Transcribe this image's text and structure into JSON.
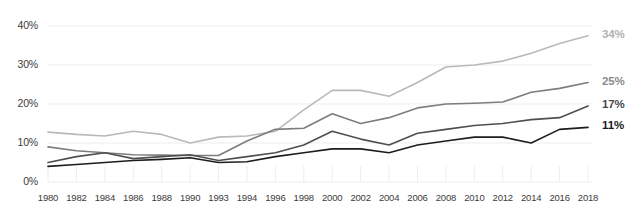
{
  "chart_data": {
    "type": "line",
    "title": "",
    "subtitle": "",
    "xlabel": "",
    "ylabel": "",
    "ylim": [
      0,
      40
    ],
    "yticks": [
      0,
      10,
      20,
      30,
      40
    ],
    "ytick_labels": [
      "0%",
      "10%",
      "20%",
      "30%",
      "40%"
    ],
    "grid": true,
    "legend_position": "end-of-line",
    "categories": [
      "1980",
      "1982",
      "1984",
      "1986",
      "1988",
      "1990",
      "1993",
      "1994",
      "1996",
      "1998",
      "2000",
      "2002",
      "2004",
      "2006",
      "2008",
      "2010",
      "2012",
      "2014",
      "2016",
      "2018"
    ],
    "series": [
      {
        "name": "series-1",
        "end_label": "34%",
        "color": "#b9b9b9",
        "label_color": "#b0b0b0",
        "values": [
          12.8,
          12.2,
          11.8,
          13.0,
          12.2,
          10.0,
          11.5,
          11.8,
          13.0,
          18.5,
          23.5,
          23.5,
          22.0,
          25.5,
          29.5,
          30.0,
          31.0,
          33.0,
          35.5,
          37.5
        ]
      },
      {
        "name": "series-2",
        "end_label": "25%",
        "color": "#7d7d7d",
        "label_color": "#8a8a8a",
        "values": [
          9.0,
          8.0,
          7.5,
          7.0,
          6.9,
          6.8,
          6.8,
          10.5,
          13.5,
          13.8,
          17.5,
          15.0,
          16.5,
          19.0,
          20.0,
          20.2,
          20.5,
          23.0,
          24.0,
          25.5
        ]
      },
      {
        "name": "series-3",
        "end_label": "17%",
        "color": "#4f4f4f",
        "label_color": "#4a4a4a",
        "values": [
          5.0,
          6.5,
          7.5,
          6.0,
          6.5,
          7.0,
          5.5,
          6.5,
          7.5,
          9.5,
          13.0,
          11.0,
          9.5,
          12.5,
          13.5,
          14.5,
          15.0,
          16.0,
          16.5,
          19.5
        ]
      },
      {
        "name": "series-4",
        "end_label": "11%",
        "color": "#1d1d1d",
        "label_color": "#1a1a1a",
        "values": [
          4.0,
          4.5,
          5.0,
          5.5,
          5.8,
          6.2,
          5.0,
          5.2,
          6.5,
          7.5,
          8.5,
          8.5,
          7.5,
          9.5,
          10.5,
          11.5,
          11.5,
          10.0,
          13.5,
          14.0
        ]
      }
    ]
  },
  "axes": {
    "x_title": "",
    "y_title": ""
  }
}
